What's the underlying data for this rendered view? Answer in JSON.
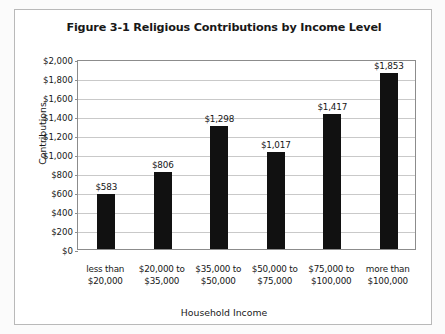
{
  "figure": {
    "title": "Figure 3-1 Religious Contributions by Income Level",
    "frame_border_color": "#b9b9b9",
    "plot_border_color": "#8c8c8c",
    "gridline_color": "#c9c9c9",
    "bar_color": "#111111",
    "background_color": "#ffffff"
  },
  "chart_data": {
    "type": "bar",
    "title": "Figure 3-1 Religious Contributions by Income Level",
    "xlabel": "Household Income",
    "ylabel": "Contributions",
    "categories": [
      "less than $20,000",
      "$20,000 to $35,000",
      "$35,000 to $50,000",
      "$50,000 to $75,000",
      "$75,000 to $100,000",
      "more than $100,000"
    ],
    "category_lines": [
      [
        "less than",
        "$20,000"
      ],
      [
        "$20,000 to",
        "$35,000"
      ],
      [
        "$35,000 to",
        "$50,000"
      ],
      [
        "$50,000 to",
        "$75,000"
      ],
      [
        "$75,000 to",
        "$100,000"
      ],
      [
        "more than",
        "$100,000"
      ]
    ],
    "values": [
      583,
      806,
      1298,
      1017,
      1417,
      1853
    ],
    "value_labels": [
      "$583",
      "$806",
      "$1,298",
      "$1,017",
      "$1,417",
      "$1,853"
    ],
    "ylim": [
      0,
      2000
    ],
    "ytick_values": [
      2000,
      1800,
      1600,
      1400,
      1200,
      1000,
      800,
      600,
      400,
      200,
      0
    ],
    "ytick_labels": [
      "$2,000",
      "$1,800",
      "$1,600",
      "$1,400",
      "$1,200",
      "$1,000",
      "$800",
      "$600",
      "$400",
      "$200",
      "$0"
    ],
    "grid": true,
    "legend": "none",
    "series": [
      {
        "name": "Contributions",
        "values": [
          583,
          806,
          1298,
          1017,
          1417,
          1853
        ]
      }
    ]
  }
}
